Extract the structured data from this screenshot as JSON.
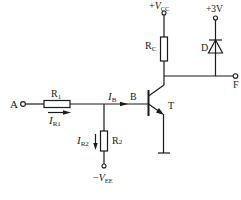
{
  "diagram": {
    "type": "circuit-schematic",
    "title": "",
    "components": {
      "input_terminal": {
        "label": "A"
      },
      "output_terminal": {
        "label": "F"
      },
      "r1": {
        "label_main": "R",
        "label_sub": "1"
      },
      "r2": {
        "label_main": "R",
        "label_sub": "2"
      },
      "rc": {
        "label_main": "R",
        "label_sub": "C"
      },
      "diode": {
        "label": "D"
      },
      "transistor": {
        "label": "T",
        "base_label": "B"
      }
    },
    "supplies": {
      "vcc": {
        "sign": "+",
        "main": "V",
        "sub": "CC"
      },
      "vee": {
        "sign": "−",
        "main": "V",
        "sub": "EE"
      },
      "v3": {
        "label": "+3V"
      }
    },
    "currents": {
      "ir1": {
        "main": "I",
        "sub": "R1"
      },
      "ir2": {
        "main": "I",
        "sub": "R2"
      },
      "ib": {
        "main": "I",
        "sub": "B"
      }
    },
    "colors": {
      "ink": "#1a1a1a",
      "background": "#ffffff"
    }
  }
}
